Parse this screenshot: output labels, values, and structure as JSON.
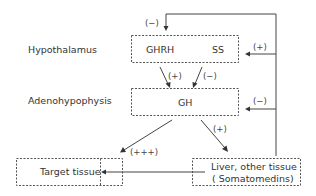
{
  "diagram": {
    "levels": {
      "hypothalamus": "Hypothalamus",
      "adenohypophysis": "Adenohypophysis"
    },
    "nodes": {
      "ghrh": "GHRH",
      "ss": "SS",
      "gh": "GH",
      "target": "Target tissue",
      "liver_line1": "Liver, other tissue",
      "liver_line2": "( Somatomedins)"
    },
    "signs": {
      "top_feedback": "(−)",
      "hypothalamus_feedback": "(+)",
      "ghrh_to_gh": "(+)",
      "ss_to_gh": "(−)",
      "pituitary_feedback": "(−)",
      "gh_to_target": "(+++)",
      "gh_to_liver": "(+)"
    },
    "edges": [
      {
        "from": "GHRH",
        "to": "GH",
        "sign": "(+)"
      },
      {
        "from": "SS",
        "to": "GH",
        "sign": "(−)"
      },
      {
        "from": "GH",
        "to": "Target tissue",
        "sign": "(+++)"
      },
      {
        "from": "GH",
        "to": "Liver, other tissue",
        "sign": "(+)"
      },
      {
        "from": "Liver, other tissue",
        "to": "Target tissue",
        "sign": ""
      },
      {
        "from": "Liver, other tissue",
        "to": "GHRH/SS box top",
        "sign": "(−)"
      },
      {
        "from": "Liver, other tissue",
        "to": "GHRH/SS box side",
        "sign": "(+)"
      },
      {
        "from": "Liver, other tissue",
        "to": "GH box side",
        "sign": "(−)"
      }
    ]
  }
}
